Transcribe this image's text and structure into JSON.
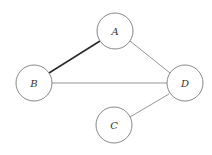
{
  "diagram": {
    "type": "undirected-graph",
    "nodes": [
      {
        "id": "A",
        "label": "A",
        "cx": 115,
        "cy": 31,
        "r": 18
      },
      {
        "id": "B",
        "label": "B",
        "cx": 34,
        "cy": 83,
        "r": 18
      },
      {
        "id": "D",
        "label": "D",
        "cx": 185,
        "cy": 83,
        "r": 18
      },
      {
        "id": "C",
        "label": "C",
        "cx": 114,
        "cy": 125,
        "r": 18
      }
    ],
    "edges": [
      {
        "from": "A",
        "to": "B",
        "emphasized": true
      },
      {
        "from": "A",
        "to": "D",
        "emphasized": false
      },
      {
        "from": "B",
        "to": "D",
        "emphasized": false
      },
      {
        "from": "C",
        "to": "D",
        "emphasized": false
      }
    ]
  }
}
